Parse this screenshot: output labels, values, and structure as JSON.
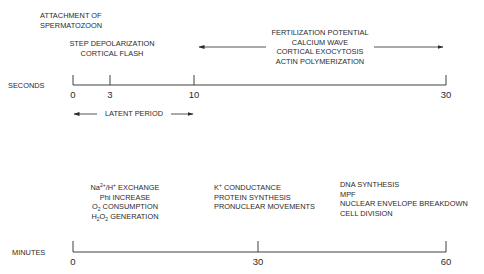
{
  "seconds_panel": {
    "axis_label": "SECONDS",
    "ticks": [
      {
        "label": "0",
        "x": 73
      },
      {
        "label": "3",
        "x": 110
      },
      {
        "label": "10",
        "x": 194
      },
      {
        "label": "30",
        "x": 446
      }
    ],
    "events": {
      "attachment": [
        "ATTACHMENT OF",
        "SPERMATOZOON"
      ],
      "step": [
        "STEP DEPOLARIZATION",
        "CORTICAL FLASH"
      ],
      "fertilization": [
        "FERTILIZATION POTENTIAL",
        "CALCIUM WAVE",
        "CORTICAL EXOCYTOSIS",
        "ACTIN POLYMERIZATION"
      ]
    },
    "latent_period_label": "LATENT PERIOD"
  },
  "minutes_panel": {
    "axis_label": "MINUTES",
    "ticks": [
      {
        "label": "0",
        "x": 73
      },
      {
        "label": "30",
        "x": 258
      },
      {
        "label": "60",
        "x": 446
      }
    ],
    "events": {
      "early": {
        "line1_a": "Na",
        "line1_sup1": "2+",
        "line1_b": "/H",
        "line1_sup2": "+",
        "line1_c": " EXCHANGE",
        "line2": "Phi INCREASE",
        "line3_a": "O",
        "line3_sub": "2",
        "line3_b": " CONSUMPTION",
        "line4_a": "H",
        "line4_sub1": "2",
        "line4_b": "O",
        "line4_sub2": "2",
        "line4_c": " GENERATION"
      },
      "middle": {
        "line1_a": "K",
        "line1_sup": "+",
        "line1_b": " CONDUCTANCE",
        "line2": "PROTEIN SYNTHESIS",
        "line3": "PRONUCLEAR MOVEMENTS"
      },
      "late": [
        "DNA SYNTHESIS",
        "MPF",
        "NUCLEAR ENVELOPE BREAKDOWN",
        "CELL DIVISION"
      ]
    }
  },
  "colors": {
    "ink": "#2a2a2a",
    "background": "#ffffff"
  }
}
